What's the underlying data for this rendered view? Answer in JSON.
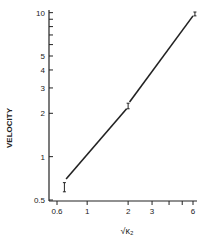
{
  "chart_data": {
    "type": "line",
    "title": "",
    "xlabel": "√κ₂",
    "ylabel": "VELOCITY",
    "xscale": "log",
    "yscale": "log",
    "xlim": [
      0.6,
      6.5
    ],
    "ylim": [
      0.5,
      10
    ],
    "grid": false,
    "legend": null,
    "x_ticks": [
      {
        "value": 0.6,
        "label": "0.6"
      },
      {
        "value": 1,
        "label": "1"
      },
      {
        "value": 2,
        "label": "2"
      },
      {
        "value": 3,
        "label": "3"
      },
      {
        "value": 4,
        "label": ""
      },
      {
        "value": 5,
        "label": ""
      },
      {
        "value": 6,
        "label": "6"
      }
    ],
    "y_ticks": [
      {
        "value": 0.5,
        "label": "0.5"
      },
      {
        "value": 1,
        "label": "1"
      },
      {
        "value": 2,
        "label": "2"
      },
      {
        "value": 3,
        "label": "3"
      },
      {
        "value": 4,
        "label": "4"
      },
      {
        "value": 5,
        "label": "5"
      },
      {
        "value": 6,
        "label": ""
      },
      {
        "value": 7,
        "label": ""
      },
      {
        "value": 8,
        "label": ""
      },
      {
        "value": 9,
        "label": ""
      },
      {
        "value": 10,
        "label": "10"
      }
    ],
    "series": [
      {
        "name": "fit line",
        "kind": "line",
        "segments": [
          {
            "x": [
              0.7,
              1.95
            ],
            "y": [
              0.7,
              2.15
            ]
          },
          {
            "x": [
              2.05,
              6.0
            ],
            "y": [
              2.4,
              9.5
            ]
          }
        ]
      },
      {
        "name": "data points",
        "kind": "errorbar",
        "points": [
          {
            "x": 0.68,
            "y": 0.61,
            "y_low": 0.57,
            "y_high": 0.66
          },
          {
            "x": 2.0,
            "y": 2.25,
            "y_low": 2.15,
            "y_high": 2.35
          },
          {
            "x": 6.2,
            "y": 9.8,
            "y_low": 9.5,
            "y_high": 10.1
          }
        ]
      }
    ]
  }
}
